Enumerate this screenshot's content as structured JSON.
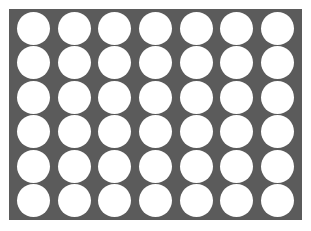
{
  "board": {
    "columns": 7,
    "rows": 6,
    "colors": {
      "board": "#5b5b5b",
      "empty_slot": "#ffffff"
    },
    "cells": [
      [
        "empty",
        "empty",
        "empty",
        "empty",
        "empty",
        "empty",
        "empty"
      ],
      [
        "empty",
        "empty",
        "empty",
        "empty",
        "empty",
        "empty",
        "empty"
      ],
      [
        "empty",
        "empty",
        "empty",
        "empty",
        "empty",
        "empty",
        "empty"
      ],
      [
        "empty",
        "empty",
        "empty",
        "empty",
        "empty",
        "empty",
        "empty"
      ],
      [
        "empty",
        "empty",
        "empty",
        "empty",
        "empty",
        "empty",
        "empty"
      ],
      [
        "empty",
        "empty",
        "empty",
        "empty",
        "empty",
        "empty",
        "empty"
      ]
    ]
  }
}
